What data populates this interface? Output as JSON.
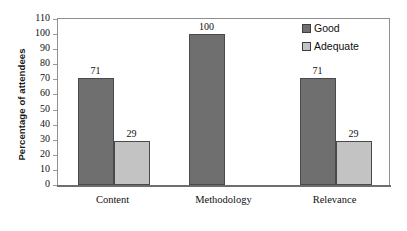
{
  "chart_data": {
    "type": "bar",
    "title": "",
    "xlabel": "",
    "ylabel": "Percentage of attendees",
    "ylim": [
      0,
      110
    ],
    "ytick_step": 10,
    "yticks": [
      110,
      100,
      90,
      80,
      70,
      60,
      50,
      40,
      30,
      20,
      10,
      0
    ],
    "grid": false,
    "legend_position": "top-right-inside",
    "categories": [
      "Content",
      "Methodology",
      "Relevance"
    ],
    "series": [
      {
        "name": "Good",
        "color": "#6f6f6f",
        "values": [
          71,
          100,
          71
        ]
      },
      {
        "name": "Adequate",
        "color": "#c3c3c3",
        "values": [
          29,
          0,
          29
        ]
      }
    ],
    "data_labels": [
      {
        "category": "Content",
        "series": "Good",
        "text": "71"
      },
      {
        "category": "Content",
        "series": "Adequate",
        "text": "29"
      },
      {
        "category": "Methodology",
        "series": "Good",
        "text": "100"
      },
      {
        "category": "Relevance",
        "series": "Good",
        "text": "71"
      },
      {
        "category": "Relevance",
        "series": "Adequate",
        "text": "29"
      }
    ]
  },
  "legend": {
    "items": [
      {
        "label": "Good",
        "swatch": "series-good"
      },
      {
        "label": "Adequate",
        "swatch": "series-adequate"
      }
    ]
  },
  "colors": {
    "good": "#6f6f6f",
    "adequate": "#c3c3c3",
    "frame": "#8f8f8f",
    "text": "#111111",
    "background": "#ffffff"
  }
}
